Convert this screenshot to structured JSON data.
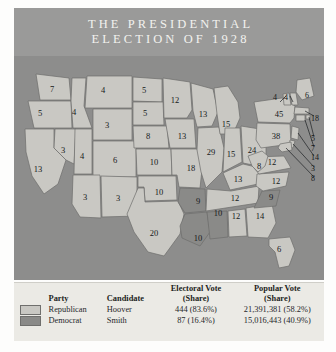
{
  "title": {
    "line1": "THE PRESIDENTIAL",
    "line2": "ELECTION OF 1928"
  },
  "colors": {
    "republican": "#c9c8c3",
    "democrat": "#8a8a88",
    "ocean": "#8d8d8c",
    "title_band": "#9a9a99",
    "legend_bg": "#ebeae5",
    "state_border": "#6d6d6b",
    "label_text": "#16181a"
  },
  "legend": {
    "headers": {
      "party": "Party",
      "candidate": "Candidate",
      "electoral": "Electoral Vote",
      "electoral_sub": "(Share)",
      "popular": "Popular Vote",
      "popular_sub": "(Share)"
    },
    "rows": [
      {
        "swatch": "republican",
        "party": "Republican",
        "candidate": "Hoover",
        "electoral": "444 (83.6%)",
        "popular": "21,391,381 (58.2%)"
      },
      {
        "swatch": "democrat",
        "party": "Democrat",
        "candidate": "Smith",
        "electoral": "87 (16.4%)",
        "popular": "15,016,443 (40.9%)"
      }
    ]
  },
  "map": {
    "type": "choropleth-electoral-map",
    "states": [
      {
        "code": "WA",
        "votes": "7",
        "party": "republican",
        "x": 38,
        "y": 33
      },
      {
        "code": "OR",
        "votes": "5",
        "party": "republican",
        "x": 26,
        "y": 57
      },
      {
        "code": "CA",
        "votes": "13",
        "party": "republican",
        "x": 24,
        "y": 113
      },
      {
        "code": "NV",
        "votes": "3",
        "party": "republican",
        "x": 49,
        "y": 94
      },
      {
        "code": "ID",
        "votes": "4",
        "party": "republican",
        "x": 60,
        "y": 56
      },
      {
        "code": "MT",
        "votes": "4",
        "party": "republican",
        "x": 89,
        "y": 34
      },
      {
        "code": "WY",
        "votes": "3",
        "party": "republican",
        "x": 93,
        "y": 69
      },
      {
        "code": "UT",
        "votes": "4",
        "party": "republican",
        "x": 68,
        "y": 100
      },
      {
        "code": "CO",
        "votes": "6",
        "party": "republican",
        "x": 101,
        "y": 104
      },
      {
        "code": "AZ",
        "votes": "3",
        "party": "republican",
        "x": 71,
        "y": 141
      },
      {
        "code": "NM",
        "votes": "3",
        "party": "republican",
        "x": 104,
        "y": 142
      },
      {
        "code": "ND",
        "votes": "5",
        "party": "republican",
        "x": 130,
        "y": 34
      },
      {
        "code": "SD",
        "votes": "5",
        "party": "republican",
        "x": 131,
        "y": 57
      },
      {
        "code": "NE",
        "votes": "8",
        "party": "republican",
        "x": 134,
        "y": 80
      },
      {
        "code": "KS",
        "votes": "10",
        "party": "republican",
        "x": 140,
        "y": 106
      },
      {
        "code": "OK",
        "votes": "10",
        "party": "republican",
        "x": 145,
        "y": 136
      },
      {
        "code": "TX",
        "votes": "20",
        "party": "republican",
        "x": 140,
        "y": 177
      },
      {
        "code": "MN",
        "votes": "12",
        "party": "republican",
        "x": 161,
        "y": 44
      },
      {
        "code": "IA",
        "votes": "13",
        "party": "republican",
        "x": 168,
        "y": 80
      },
      {
        "code": "MO",
        "votes": "18",
        "party": "republican",
        "x": 177,
        "y": 112
      },
      {
        "code": "AR",
        "votes": "9",
        "party": "democrat",
        "x": 184,
        "y": 145
      },
      {
        "code": "LA",
        "votes": "10",
        "party": "democrat",
        "x": 184,
        "y": 182
      },
      {
        "code": "WI",
        "votes": "13",
        "party": "republican",
        "x": 189,
        "y": 58
      },
      {
        "code": "IL",
        "votes": "29",
        "party": "republican",
        "x": 197,
        "y": 96
      },
      {
        "code": "MI",
        "votes": "15",
        "party": "republican",
        "x": 212,
        "y": 68
      },
      {
        "code": "IN",
        "votes": "15",
        "party": "republican",
        "x": 217,
        "y": 98
      },
      {
        "code": "OH",
        "votes": "24",
        "party": "republican",
        "x": 238,
        "y": 94
      },
      {
        "code": "KY",
        "votes": "13",
        "party": "republican",
        "x": 224,
        "y": 123
      },
      {
        "code": "TN",
        "votes": "12",
        "party": "republican",
        "x": 221,
        "y": 142
      },
      {
        "code": "MS",
        "votes": "10",
        "party": "democrat",
        "x": 204,
        "y": 157
      },
      {
        "code": "AL",
        "votes": "12",
        "party": "republican",
        "x": 222,
        "y": 160
      },
      {
        "code": "GA",
        "votes": "14",
        "party": "republican",
        "x": 246,
        "y": 160
      },
      {
        "code": "FL",
        "votes": "6",
        "party": "republican",
        "x": 265,
        "y": 193
      },
      {
        "code": "SC",
        "votes": "9",
        "party": "democrat",
        "x": 257,
        "y": 141
      },
      {
        "code": "NC",
        "votes": "12",
        "party": "republican",
        "x": 262,
        "y": 125
      },
      {
        "code": "VA",
        "votes": "12",
        "party": "republican",
        "x": 258,
        "y": 106
      },
      {
        "code": "WV",
        "votes": "8",
        "party": "republican",
        "x": 245,
        "y": 110
      },
      {
        "code": "PA",
        "votes": "38",
        "party": "republican",
        "x": 262,
        "y": 80
      },
      {
        "code": "NY",
        "votes": "45",
        "party": "republican",
        "x": 265,
        "y": 58
      }
    ],
    "leader_labels": [
      {
        "code": "VT",
        "votes": "4",
        "x": 259,
        "y": 42
      },
      {
        "code": "NH",
        "votes": "4",
        "x": 270,
        "y": 42
      },
      {
        "code": "ME",
        "votes": "6",
        "x": 291,
        "y": 40
      },
      {
        "code": "MA",
        "votes": "18",
        "x": 297,
        "y": 63
      },
      {
        "code": "RI",
        "votes": "5",
        "x": 297,
        "y": 83
      },
      {
        "code": "CT",
        "votes": "7",
        "x": 297,
        "y": 93
      },
      {
        "code": "NJ",
        "votes": "14",
        "x": 297,
        "y": 102
      },
      {
        "code": "DE",
        "votes": "3",
        "x": 297,
        "y": 113
      },
      {
        "code": "MD",
        "votes": "8",
        "x": 297,
        "y": 123
      }
    ]
  }
}
